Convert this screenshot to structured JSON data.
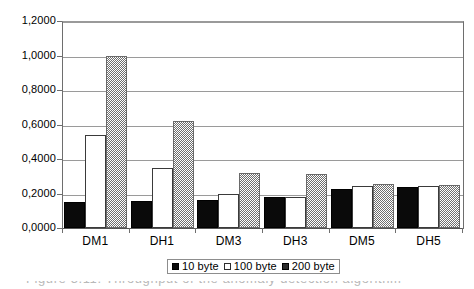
{
  "chart_data": {
    "type": "bar",
    "title": "",
    "subtitle": "",
    "xlabel": "",
    "ylabel": "",
    "categories": [
      "DM1",
      "DH1",
      "DM3",
      "DH3",
      "DM5",
      "DH5"
    ],
    "series": [
      {
        "name": "10 byte",
        "values": [
          0.148,
          0.157,
          0.164,
          0.178,
          0.225,
          0.239
        ]
      },
      {
        "name": "100 byte",
        "values": [
          0.538,
          0.35,
          0.198,
          0.182,
          0.242,
          0.245
        ]
      },
      {
        "name": "200 byte",
        "values": [
          1.0,
          0.618,
          0.319,
          0.316,
          0.255,
          0.25
        ]
      }
    ],
    "ylim": [
      0.0,
      1.2
    ],
    "ytick_step": 0.2,
    "ytick_labels": [
      "0,0000",
      "0,2000",
      "0,4000",
      "0,6000",
      "0,8000",
      "1,0000",
      "1,2000"
    ],
    "ytick_values": [
      0.0,
      0.2,
      0.4,
      0.6,
      0.8,
      1.0,
      1.2
    ],
    "decimal_separator": ",",
    "grid": "horizontal",
    "legend_position": "bottom-center",
    "legend_entries": [
      {
        "label": "10 byte",
        "swatch": "solid-black",
        "color": "#0a0a0a"
      },
      {
        "label": "100 byte",
        "swatch": "hollow-white",
        "color": "#ffffff"
      },
      {
        "label": "200 byte",
        "swatch": "gray-dither",
        "color": "#6f6f6f"
      }
    ]
  },
  "caption": {
    "clipped_text": "Figure 5.11. Throughput of the anomaly detection algorithm"
  }
}
